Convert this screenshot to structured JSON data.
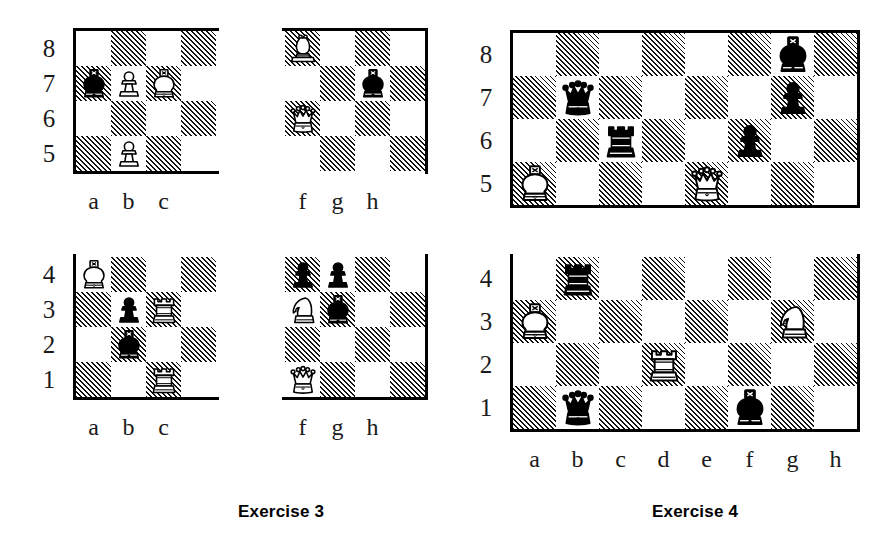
{
  "figure": {
    "type": "chess-diagram-pair"
  },
  "exercises": [
    {
      "caption": "Exercise 3",
      "caption_left": 238,
      "caption_top": 502,
      "fragments": [
        {
          "id": "ex3-upper-left",
          "files": [
            "a",
            "b",
            "c"
          ],
          "ranks": [
            "8",
            "7",
            "6",
            "5"
          ],
          "file_labels": [
            "a",
            "b",
            "c"
          ],
          "rank_labels": [
            "8",
            "7",
            "6",
            "5"
          ],
          "left": 76,
          "top": 31,
          "cell": 35,
          "cols": 4,
          "rows": 4,
          "edges": {
            "top": true,
            "left": true,
            "right": false,
            "bottom": true
          },
          "pieces": [
            {
              "square": "a7",
              "col": 0,
              "row": 1,
              "color": "black",
              "type": "king"
            },
            {
              "square": "b7",
              "col": 1,
              "row": 1,
              "color": "white",
              "type": "pawn"
            },
            {
              "square": "c7",
              "col": 2,
              "row": 1,
              "color": "white",
              "type": "king"
            },
            {
              "square": "b5",
              "col": 1,
              "row": 3,
              "color": "white",
              "type": "pawn"
            }
          ]
        },
        {
          "id": "ex3-upper-right",
          "files": [
            "f",
            "g",
            "h"
          ],
          "ranks": [
            "8",
            "7",
            "6",
            "5"
          ],
          "file_labels": [
            "f",
            "g",
            "h"
          ],
          "rank_labels": [],
          "left": 285,
          "top": 31,
          "cell": 35,
          "cols": 4,
          "rows": 4,
          "edges": {
            "top": true,
            "left": false,
            "right": true,
            "bottom": false
          },
          "pieces": [
            {
              "square": "f8",
              "col": 0,
              "row": 0,
              "color": "white",
              "type": "bishop"
            },
            {
              "square": "h7",
              "col": 2,
              "row": 1,
              "color": "black",
              "type": "king"
            },
            {
              "square": "f6",
              "col": 0,
              "row": 2,
              "color": "white",
              "type": "queen"
            }
          ]
        },
        {
          "id": "ex3-lower-left",
          "files": [
            "a",
            "b",
            "c"
          ],
          "ranks": [
            "4",
            "3",
            "2",
            "1"
          ],
          "file_labels": [
            "a",
            "b",
            "c"
          ],
          "rank_labels": [
            "4",
            "3",
            "2",
            "1"
          ],
          "left": 76,
          "top": 257,
          "cell": 35,
          "cols": 4,
          "rows": 4,
          "edges": {
            "top": false,
            "left": true,
            "right": false,
            "bottom": true
          },
          "pieces": [
            {
              "square": "a4",
              "col": 0,
              "row": 0,
              "color": "white",
              "type": "king"
            },
            {
              "square": "b3",
              "col": 1,
              "row": 1,
              "color": "black",
              "type": "pawn"
            },
            {
              "square": "c3",
              "col": 2,
              "row": 1,
              "color": "white",
              "type": "rook"
            },
            {
              "square": "b2",
              "col": 1,
              "row": 2,
              "color": "black",
              "type": "king"
            },
            {
              "square": "c1",
              "col": 2,
              "row": 3,
              "color": "white",
              "type": "rook"
            }
          ]
        },
        {
          "id": "ex3-lower-right",
          "files": [
            "f",
            "g",
            "h"
          ],
          "ranks": [
            "4",
            "3",
            "2",
            "1"
          ],
          "file_labels": [
            "f",
            "g",
            "h"
          ],
          "rank_labels": [],
          "left": 285,
          "top": 257,
          "cell": 35,
          "cols": 4,
          "rows": 4,
          "edges": {
            "top": false,
            "left": false,
            "right": true,
            "bottom": true
          },
          "pieces": [
            {
              "square": "f4",
              "col": 0,
              "row": 0,
              "color": "black",
              "type": "pawn"
            },
            {
              "square": "g4",
              "col": 1,
              "row": 0,
              "color": "black",
              "type": "pawn"
            },
            {
              "square": "f3",
              "col": 0,
              "row": 1,
              "color": "white",
              "type": "knight"
            },
            {
              "square": "g3",
              "col": 1,
              "row": 1,
              "color": "black",
              "type": "king"
            },
            {
              "square": "f1",
              "col": 0,
              "row": 3,
              "color": "white",
              "type": "queen"
            }
          ]
        }
      ]
    },
    {
      "caption": "Exercise 4",
      "caption_left": 652,
      "caption_top": 502,
      "fragments": [
        {
          "id": "ex4-upper",
          "files": [
            "a",
            "b",
            "c",
            "d",
            "e",
            "f",
            "g",
            "h"
          ],
          "ranks": [
            "8",
            "7",
            "6",
            "5"
          ],
          "file_labels": [],
          "rank_labels": [
            "8",
            "7",
            "6",
            "5"
          ],
          "left": 513,
          "top": 33,
          "cell": 43,
          "cols": 8,
          "rows": 4,
          "edges": {
            "top": true,
            "left": true,
            "right": true,
            "bottom": true
          },
          "pieces": [
            {
              "square": "g8",
              "col": 6,
              "row": 0,
              "color": "black",
              "type": "king"
            },
            {
              "square": "b7",
              "col": 1,
              "row": 1,
              "color": "black",
              "type": "queen"
            },
            {
              "square": "g7",
              "col": 6,
              "row": 1,
              "color": "black",
              "type": "pawn"
            },
            {
              "square": "c6",
              "col": 2,
              "row": 2,
              "color": "black",
              "type": "rook"
            },
            {
              "square": "f6",
              "col": 5,
              "row": 2,
              "color": "black",
              "type": "pawn"
            },
            {
              "square": "a5",
              "col": 0,
              "row": 3,
              "color": "white",
              "type": "king"
            },
            {
              "square": "e5",
              "col": 4,
              "row": 3,
              "color": "white",
              "type": "queen"
            }
          ]
        },
        {
          "id": "ex4-lower",
          "files": [
            "a",
            "b",
            "c",
            "d",
            "e",
            "f",
            "g",
            "h"
          ],
          "ranks": [
            "4",
            "3",
            "2",
            "1"
          ],
          "file_labels": [
            "a",
            "b",
            "c",
            "d",
            "e",
            "f",
            "g",
            "h"
          ],
          "rank_labels": [
            "4",
            "3",
            "2",
            "1"
          ],
          "left": 513,
          "top": 257,
          "cell": 43,
          "cols": 8,
          "rows": 4,
          "edges": {
            "top": false,
            "left": true,
            "right": true,
            "bottom": true
          },
          "pieces": [
            {
              "square": "b4",
              "col": 1,
              "row": 0,
              "color": "black",
              "type": "rook"
            },
            {
              "square": "a3",
              "col": 0,
              "row": 1,
              "color": "white",
              "type": "king"
            },
            {
              "square": "g3",
              "col": 6,
              "row": 1,
              "color": "white",
              "type": "knight"
            },
            {
              "square": "d2",
              "col": 3,
              "row": 2,
              "color": "white",
              "type": "rook"
            },
            {
              "square": "b1",
              "col": 1,
              "row": 3,
              "color": "black",
              "type": "queen"
            },
            {
              "square": "f1",
              "col": 5,
              "row": 3,
              "color": "black",
              "type": "king"
            }
          ]
        }
      ]
    }
  ],
  "colors": {
    "ink": "#000000",
    "paper": "#ffffff",
    "label": "#1a1a1a"
  }
}
